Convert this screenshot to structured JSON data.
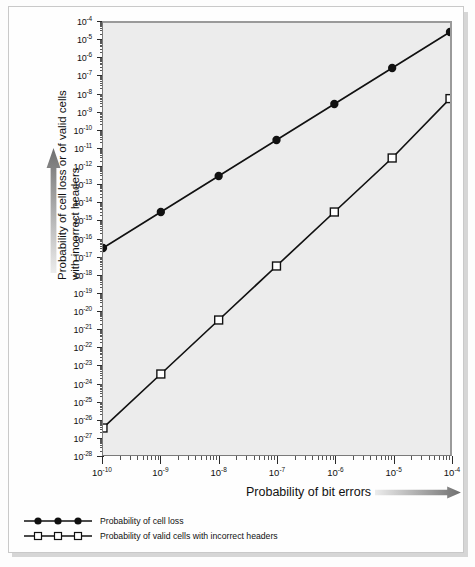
{
  "chart_data": {
    "type": "line",
    "title": "",
    "xlabel": "Probability of bit errors",
    "ylabel": "Probability of cell loss or of valid cells\nwith incorrect headers",
    "xscale": "log",
    "yscale": "log",
    "xlim": [
      1e-10,
      0.0001
    ],
    "ylim": [
      1e-28,
      0.0001
    ],
    "grid": false,
    "legend_position": "below-left",
    "x_tick_labels": [
      "10-10",
      "10-9",
      "10-8",
      "10-7",
      "10-6",
      "10-5",
      "10-4"
    ],
    "x_tick_exponents": [
      -10,
      -9,
      -8,
      -7,
      -6,
      -5,
      -4
    ],
    "y_tick_exponents": [
      -4,
      -5,
      -6,
      -7,
      -8,
      -9,
      -10,
      -11,
      -12,
      -13,
      -14,
      -15,
      -16,
      -17,
      -18,
      -19,
      -20,
      -21,
      -22,
      -23,
      -24,
      -25,
      -26,
      -27,
      -28
    ],
    "x": [
      1e-10,
      1e-09,
      1e-08,
      1e-07,
      1e-06,
      1e-05,
      0.0001
    ],
    "series": [
      {
        "name": "Probability of cell loss",
        "marker": "filled-circle",
        "values": [
          3e-17,
          3e-15,
          3e-13,
          3e-11,
          3e-09,
          3e-07,
          3e-05
        ],
        "exponents": [
          -16.5,
          -14.5,
          -12.5,
          -10.5,
          -8.5,
          -6.5,
          -4.5
        ]
      },
      {
        "name": "Probability of valid cells with incorrect headers",
        "marker": "open-square",
        "values": [
          3e-27,
          3e-24,
          3e-21,
          3e-18,
          3e-15,
          3e-12,
          6e-09
        ],
        "exponents": [
          -26.5,
          -23.5,
          -20.5,
          -17.5,
          -14.5,
          -11.5,
          -8.2
        ]
      }
    ]
  },
  "axes": {
    "x_title": "Probability of bit errors",
    "y_title_line1": "Probability of cell loss or of valid cells",
    "y_title_line2": "with incorrect headers"
  },
  "legend": {
    "items": [
      {
        "label": "Probability of cell loss",
        "marker": "filled-circle"
      },
      {
        "label": "Probability of valid cells with incorrect headers",
        "marker": "open-square"
      }
    ]
  },
  "colors": {
    "plot_background": "#ececec",
    "line": "#111111",
    "frame": "#c9c9c9",
    "page_background": "#fdfdfd",
    "arrow_dark": "#6f6f6f",
    "arrow_light": "#e8e8e8"
  }
}
